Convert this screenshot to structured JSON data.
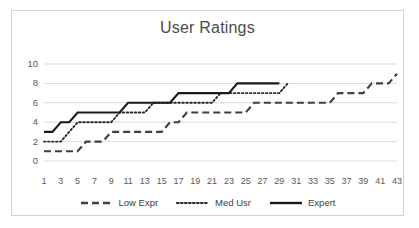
{
  "chart_data": {
    "type": "line",
    "title": "User Ratings",
    "xlabel": "",
    "ylabel": "",
    "xlim": [
      1,
      43
    ],
    "ylim": [
      0,
      10
    ],
    "grid": true,
    "legend_position": "bottom",
    "x_tick_labels": [
      "1",
      "3",
      "5",
      "7",
      "9",
      "11",
      "13",
      "15",
      "17",
      "19",
      "21",
      "23",
      "25",
      "27",
      "29",
      "31",
      "33",
      "35",
      "37",
      "39",
      "41",
      "43"
    ],
    "y_tick_labels": [
      "0",
      "2",
      "4",
      "6",
      "8",
      "10"
    ],
    "x": [
      1,
      2,
      3,
      4,
      5,
      6,
      7,
      8,
      9,
      10,
      11,
      12,
      13,
      14,
      15,
      16,
      17,
      18,
      19,
      20,
      21,
      22,
      23,
      24,
      25,
      26,
      27,
      28,
      29,
      30,
      31,
      32,
      33,
      34,
      35,
      36,
      37,
      38,
      39,
      40,
      41,
      42,
      43
    ],
    "series": [
      {
        "name": "Low Expr",
        "style": "dashed",
        "color": "#3f3f3f",
        "values": [
          1,
          1,
          1,
          1,
          1,
          2,
          2,
          2,
          3,
          3,
          3,
          3,
          3,
          3,
          3,
          4,
          4,
          5,
          5,
          5,
          5,
          5,
          5,
          5,
          5,
          6,
          6,
          6,
          6,
          6,
          6,
          6,
          6,
          6,
          6,
          7,
          7,
          7,
          7,
          8,
          8,
          8,
          9
        ]
      },
      {
        "name": "Med Usr",
        "style": "dotted",
        "color": "#2b2b2b",
        "values": [
          2,
          2,
          2,
          3,
          4,
          4,
          4,
          4,
          4,
          5,
          5,
          5,
          5,
          6,
          6,
          6,
          6,
          6,
          6,
          6,
          6,
          7,
          7,
          7,
          7,
          7,
          7,
          7,
          7,
          8,
          null,
          null,
          null,
          null,
          null,
          null,
          null,
          null,
          null,
          null,
          null,
          null,
          null
        ]
      },
      {
        "name": "Expert",
        "style": "solid",
        "color": "#1a1a1a",
        "values": [
          3,
          3,
          4,
          4,
          5,
          5,
          5,
          5,
          5,
          5,
          6,
          6,
          6,
          6,
          6,
          6,
          7,
          7,
          7,
          7,
          7,
          7,
          7,
          8,
          8,
          8,
          8,
          8,
          8,
          null,
          null,
          null,
          null,
          null,
          null,
          null,
          null,
          null,
          null,
          null,
          null,
          null,
          null
        ]
      }
    ]
  }
}
